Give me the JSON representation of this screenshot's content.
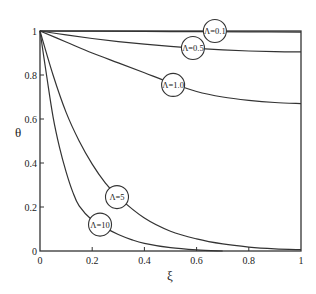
{
  "chart_data": {
    "type": "line",
    "title": "",
    "xlabel": "ξ",
    "ylabel": "θ",
    "xlim": [
      0,
      1
    ],
    "ylim": [
      0,
      1
    ],
    "grid": false,
    "legend_position": "inline circled labels on curves",
    "x_ticks": [
      "0",
      "0.2",
      "0.4",
      "0.6",
      "0.8",
      "1"
    ],
    "y_ticks": [
      "0",
      "0.2",
      "0.4",
      "0.6",
      "0.8",
      "1"
    ],
    "series": [
      {
        "name": "Λ=0.1",
        "x": [
          0,
          0.2,
          0.4,
          0.6,
          0.8,
          1.0
        ],
        "y": [
          1.0,
          0.999,
          0.998,
          0.997,
          0.996,
          0.995
        ],
        "label_pos": [
          0.67,
          1.0
        ]
      },
      {
        "name": "Λ=0.5",
        "x": [
          0,
          0.1,
          0.2,
          0.3,
          0.4,
          0.5,
          0.6,
          0.7,
          0.8,
          0.9,
          1.0
        ],
        "y": [
          1.0,
          0.982,
          0.966,
          0.952,
          0.94,
          0.93,
          0.921,
          0.914,
          0.909,
          0.906,
          0.905
        ],
        "label_pos": [
          0.586,
          0.923
        ]
      },
      {
        "name": "Λ=1.0",
        "x": [
          0,
          0.1,
          0.2,
          0.3,
          0.4,
          0.5,
          0.6,
          0.7,
          0.8,
          0.9,
          1.0
        ],
        "y": [
          1.0,
          0.95,
          0.9,
          0.855,
          0.81,
          0.765,
          0.725,
          0.7,
          0.685,
          0.675,
          0.67
        ],
        "label_pos": [
          0.51,
          0.755
        ]
      },
      {
        "name": "Λ=5",
        "x": [
          0,
          0.05,
          0.1,
          0.15,
          0.2,
          0.25,
          0.3,
          0.4,
          0.5,
          0.6,
          0.7,
          0.8,
          0.9,
          1.0
        ],
        "y": [
          1.0,
          0.8,
          0.63,
          0.5,
          0.395,
          0.31,
          0.245,
          0.15,
          0.09,
          0.055,
          0.032,
          0.018,
          0.01,
          0.006
        ],
        "label_pos": [
          0.295,
          0.245
        ]
      },
      {
        "name": "Λ=10",
        "x": [
          0,
          0.025,
          0.05,
          0.075,
          0.1,
          0.125,
          0.15,
          0.2,
          0.25,
          0.3,
          0.35,
          0.4,
          0.5,
          0.6,
          0.7
        ],
        "y": [
          1.0,
          0.8,
          0.61,
          0.47,
          0.36,
          0.27,
          0.205,
          0.14,
          0.105,
          0.075,
          0.052,
          0.035,
          0.015,
          0.005,
          0.0
        ],
        "label_pos": [
          0.23,
          0.12
        ]
      }
    ]
  },
  "labels": {
    "xlabel": "ξ",
    "ylabel": "θ"
  }
}
